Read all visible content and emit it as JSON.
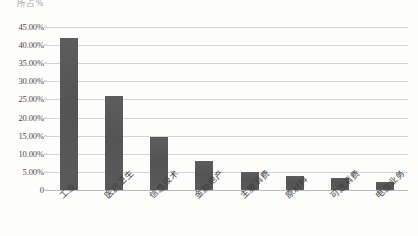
{
  "chart_data": {
    "type": "bar",
    "title": "",
    "header_text": "所占%",
    "xlabel": "",
    "ylabel": "",
    "ylim": [
      0,
      45
    ],
    "grid": true,
    "legend": "none",
    "categories": [
      "工业",
      "医药卫生",
      "信息技术",
      "金融地产",
      "主要消费",
      "原材料",
      "可选消费",
      "电信业务"
    ],
    "values": [
      42.0,
      26.0,
      14.5,
      8.0,
      5.0,
      3.8,
      3.3,
      2.3
    ],
    "ytick_labels": [
      "45.00%",
      "40.00%",
      "35.00%",
      "30.00%",
      "25.00%",
      "20.00%",
      "15.00%",
      "10.00%",
      "5.00%",
      "0"
    ],
    "ytick_values": [
      45,
      40,
      35,
      30,
      25,
      20,
      15,
      10,
      5,
      0
    ],
    "series": [
      {
        "name": "占比",
        "values": [
          42.0,
          26.0,
          14.5,
          8.0,
          5.0,
          3.8,
          3.3,
          2.3
        ]
      }
    ]
  },
  "colors": {
    "bar": "#585858",
    "gridline": "#d3d3d3",
    "axis": "#b9b9b9",
    "text": "#3f3f3f",
    "background": "#fdfdfc"
  }
}
